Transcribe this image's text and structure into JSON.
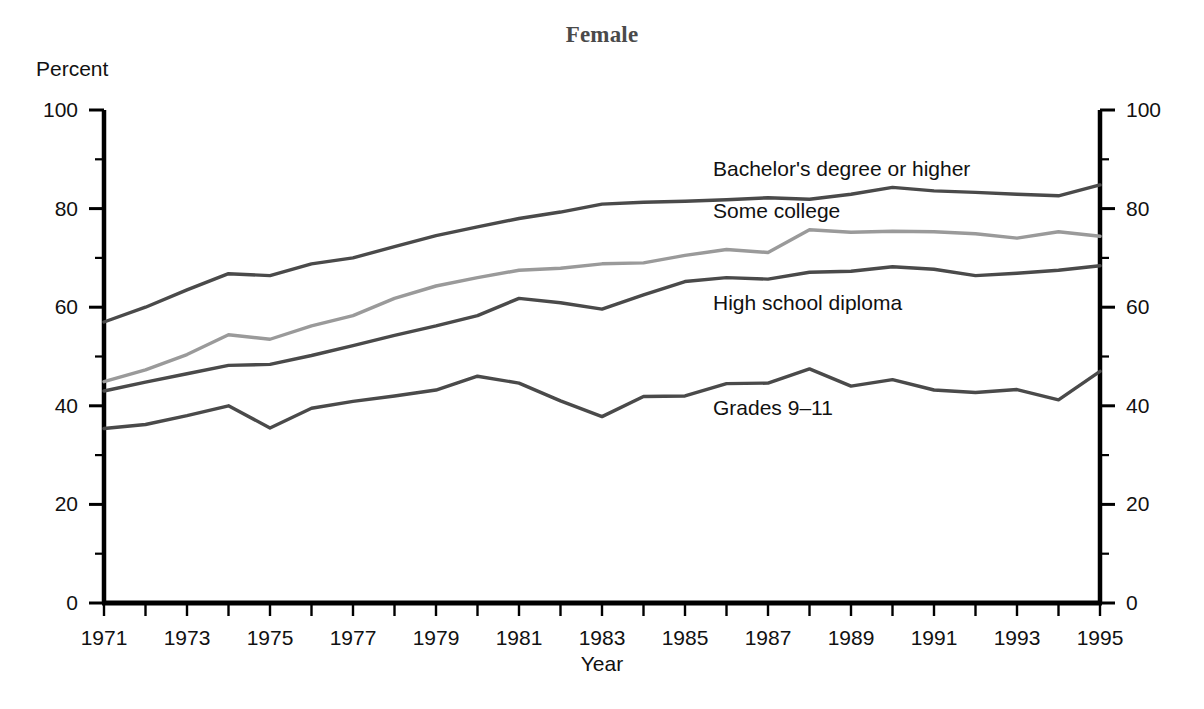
{
  "title": "Female",
  "axis": {
    "y_unit_label": "Percent",
    "x_title": "Year",
    "y_ticks": [
      "0",
      "20",
      "40",
      "60",
      "80",
      "100"
    ],
    "y_ticks_right": [
      "0",
      "20",
      "40",
      "60",
      "80",
      "100"
    ],
    "x_ticks": [
      "1971",
      "1973",
      "1975",
      "1977",
      "1979",
      "1981",
      "1983",
      "1985",
      "1987",
      "1989",
      "1991",
      "1993",
      "1995"
    ]
  },
  "series_labels": {
    "bachelors": "Bachelor's degree or higher",
    "some_college": "Some college",
    "high_school": "High school diploma",
    "grades": "Grades 9–11"
  },
  "colors": {
    "axis": "#000000",
    "line_dark": "#4a4a4a",
    "line_light": "#9a9a9a",
    "text": "#111111",
    "title": "#4a4a4a",
    "background": "#ffffff"
  },
  "chart_data": {
    "type": "line",
    "title": "Female",
    "xlabel": "Year",
    "ylabel": "Percent",
    "xlim": [
      1971,
      1995
    ],
    "ylim": [
      0,
      100
    ],
    "grid": false,
    "legend": "inline-labels",
    "x": [
      1971,
      1972,
      1973,
      1974,
      1975,
      1976,
      1977,
      1978,
      1979,
      1980,
      1981,
      1982,
      1983,
      1984,
      1985,
      1986,
      1987,
      1988,
      1989,
      1990,
      1991,
      1992,
      1993,
      1994,
      1995
    ],
    "series": [
      {
        "name": "Bachelor's degree or higher",
        "color": "#4a4a4a",
        "values": [
          57.0,
          60.0,
          63.5,
          66.8,
          66.4,
          68.8,
          70.0,
          72.3,
          74.5,
          76.3,
          78.0,
          79.3,
          80.9,
          81.3,
          81.5,
          81.8,
          82.2,
          81.9,
          82.9,
          84.3,
          83.6,
          83.3,
          82.9,
          82.6,
          84.8
        ]
      },
      {
        "name": "Some college",
        "color": "#9a9a9a",
        "values": [
          44.9,
          47.3,
          50.4,
          54.4,
          53.5,
          56.2,
          58.3,
          61.8,
          64.3,
          66.0,
          67.5,
          67.9,
          68.8,
          69.0,
          70.5,
          71.7,
          71.1,
          75.7,
          75.2,
          75.4,
          75.3,
          74.9,
          74.0,
          75.3,
          74.4
        ]
      },
      {
        "name": "High school diploma",
        "color": "#4a4a4a",
        "values": [
          43.0,
          44.8,
          46.5,
          48.2,
          48.4,
          50.2,
          52.2,
          54.3,
          56.2,
          58.3,
          61.8,
          60.9,
          59.6,
          62.5,
          65.2,
          66.0,
          65.7,
          67.1,
          67.3,
          68.2,
          67.7,
          66.4,
          66.9,
          67.5,
          68.4
        ]
      },
      {
        "name": "Grades 9–11",
        "color": "#4a4a4a",
        "values": [
          35.4,
          36.2,
          38.0,
          40.0,
          35.5,
          39.5,
          40.9,
          42.0,
          43.2,
          46.0,
          44.6,
          41.0,
          37.8,
          41.9,
          42.0,
          44.5,
          44.6,
          47.5,
          44.0,
          45.3,
          43.2,
          42.7,
          43.3,
          41.2,
          47.0
        ]
      }
    ]
  }
}
